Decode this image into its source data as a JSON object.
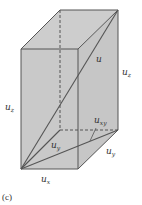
{
  "figure": {
    "caption": "(c)",
    "colors": {
      "face": "#c9c9c9",
      "edge": "#555555",
      "text": "#333333",
      "background": "#ffffff"
    },
    "labels": {
      "u": {
        "base": "u",
        "sub": ""
      },
      "uz_left": {
        "base": "u",
        "sub": "z"
      },
      "uz_right": {
        "base": "u",
        "sub": "z"
      },
      "uxy": {
        "base": "u",
        "sub": "xy"
      },
      "uy_inner": {
        "base": "u",
        "sub": "y"
      },
      "uy_outer": {
        "base": "u",
        "sub": "y"
      },
      "ux": {
        "base": "u",
        "sub": "x"
      }
    }
  }
}
